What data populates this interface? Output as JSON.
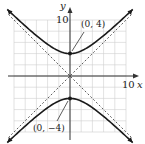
{
  "chart_data": {
    "type": "line",
    "title": "",
    "xlabel": "x",
    "ylabel": "y",
    "xlim": [
      -10,
      10
    ],
    "ylim": [
      -10,
      10
    ],
    "grid": true,
    "grid_step": 2,
    "tick_labels": {
      "x": "10",
      "y": "10"
    },
    "series": [
      {
        "name": "hyperbola upper branch",
        "equation": "y^2/16 - x^2/16 = 1",
        "branch": "upper",
        "style": "solid"
      },
      {
        "name": "hyperbola lower branch",
        "equation": "y^2/16 - x^2/16 = 1",
        "branch": "lower",
        "style": "solid"
      },
      {
        "name": "asymptote",
        "equation": "y = x",
        "style": "dashed"
      },
      {
        "name": "asymptote",
        "equation": "y = -x",
        "style": "dashed"
      }
    ],
    "points": [
      {
        "x": 0,
        "y": 4,
        "label": "(0, 4)"
      },
      {
        "x": 0,
        "y": -4,
        "label": "(0, −4)"
      }
    ]
  },
  "labels": {
    "x_axis": "x",
    "y_axis": "y",
    "x_tick": "10",
    "y_tick": "10",
    "vertex_top": "(0, 4)",
    "vertex_bottom": "(0, −4)"
  },
  "colors": {
    "grid": "#cfcfcf",
    "axis": "#333333",
    "curve": "#1a1a1a"
  }
}
